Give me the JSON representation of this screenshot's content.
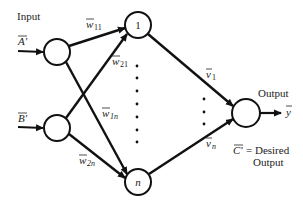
{
  "labels": {
    "input": "Input",
    "output": "Output",
    "input_a": "A'",
    "input_b": "B'",
    "hidden_first": "1",
    "hidden_last": "n",
    "output_var": "y",
    "desired_line1": "C' = Desired",
    "desired_line1_var": "C'",
    "desired_line1_text": "= Desired",
    "desired_line2": "Output"
  },
  "weights": {
    "w11": {
      "base": "w",
      "sub": "11"
    },
    "w21": {
      "base": "w",
      "sub": "21"
    },
    "w1n": {
      "base": "w",
      "sub": "1n"
    },
    "w2n": {
      "base": "w",
      "sub": "2n"
    },
    "v1": {
      "base": "v",
      "sub": "1"
    },
    "vn": {
      "base": "v",
      "sub": "n"
    }
  },
  "nodes": {
    "inputs": [
      {
        "id": "A",
        "cx": 57,
        "cy": 52
      },
      {
        "id": "B",
        "cx": 57,
        "cy": 128
      }
    ],
    "hidden": [
      {
        "id": "1",
        "cx": 138,
        "cy": 25
      },
      {
        "id": "n",
        "cx": 138,
        "cy": 182
      }
    ],
    "output": {
      "id": "out",
      "cx": 246,
      "cy": 113
    }
  },
  "colors": {
    "stroke": "#111111",
    "text": "#222222",
    "background": "#ffffff"
  }
}
